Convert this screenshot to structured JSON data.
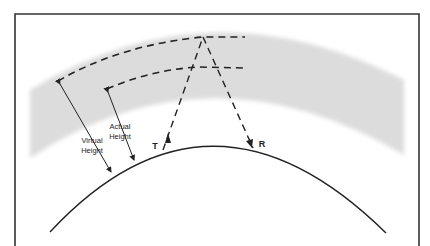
{
  "diagram": {
    "labels": {
      "virtual_height": [
        "Virtual",
        "Height"
      ],
      "actual_height": [
        "Actual",
        "Height"
      ],
      "transmitter": "T",
      "receiver": "R"
    },
    "colors": {
      "border": "#333333",
      "ionosphere_band": "#dcdcdc",
      "lines": "#222222",
      "background": "#ffffff"
    },
    "elements": [
      "frame border",
      "shaded ionosphere band",
      "earth surface arc",
      "virtual height dashed arc",
      "actual height dashed arc",
      "dashed ray path T to apex to R",
      "virtual height arrow",
      "actual height arrow"
    ]
  }
}
